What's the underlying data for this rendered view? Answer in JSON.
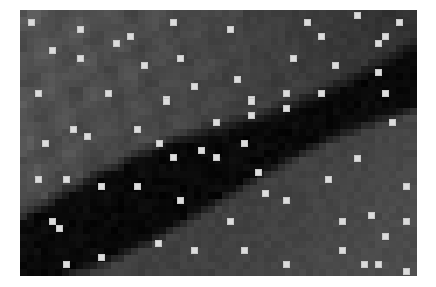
{
  "image": {
    "frame": {
      "x": 20,
      "y": 10,
      "width": 397,
      "height": 266
    },
    "cell_size": 7,
    "colors": {
      "background": "#ffffff",
      "marker": "#dcdcdc",
      "tone_light": "#5c5c5c",
      "tone_mid": "#474747",
      "tone_dark": "#333333",
      "tone_black": "#060606",
      "tone_lower_right": "#4a4a4a"
    },
    "regions": [
      {
        "name": "upper-left-mid-gray",
        "tone": "tone_mid"
      },
      {
        "name": "upper-right-dark-gray",
        "tone": "tone_dark"
      },
      {
        "name": "diagonal-black-band",
        "tone": "tone_black"
      },
      {
        "name": "lower-right-mid-gray",
        "tone": "tone_lower_right"
      }
    ]
  },
  "markers": [
    [
      31,
      22
    ],
    [
      80,
      29
    ],
    [
      130,
      36
    ],
    [
      116,
      43
    ],
    [
      52,
      50
    ],
    [
      80,
      58
    ],
    [
      144,
      65
    ],
    [
      38,
      93
    ],
    [
      108,
      93
    ],
    [
      173,
      22
    ],
    [
      230,
      29
    ],
    [
      180,
      58
    ],
    [
      237,
      79
    ],
    [
      194,
      86
    ],
    [
      166,
      99
    ],
    [
      251,
      99
    ],
    [
      357,
      15
    ],
    [
      307,
      22
    ],
    [
      399,
      22
    ],
    [
      321,
      36
    ],
    [
      385,
      36
    ],
    [
      378,
      43
    ],
    [
      293,
      58
    ],
    [
      335,
      65
    ],
    [
      378,
      72
    ],
    [
      286,
      93
    ],
    [
      321,
      93
    ],
    [
      385,
      93
    ],
    [
      73,
      129
    ],
    [
      137,
      129
    ],
    [
      87,
      136
    ],
    [
      45,
      143
    ],
    [
      38,
      179
    ],
    [
      66,
      179
    ],
    [
      101,
      186
    ],
    [
      137,
      186
    ],
    [
      166,
      101
    ],
    [
      251,
      101
    ],
    [
      251,
      115
    ],
    [
      216,
      122
    ],
    [
      159,
      143
    ],
    [
      244,
      143
    ],
    [
      201,
      150
    ],
    [
      173,
      157
    ],
    [
      216,
      157
    ],
    [
      258,
      172
    ],
    [
      286,
      108
    ],
    [
      392,
      122
    ],
    [
      357,
      158
    ],
    [
      328,
      179
    ],
    [
      406,
      186
    ],
    [
      52,
      221
    ],
    [
      59,
      228
    ],
    [
      101,
      257
    ],
    [
      66,
      264
    ],
    [
      265,
      193
    ],
    [
      180,
      200
    ],
    [
      230,
      221
    ],
    [
      158,
      243
    ],
    [
      194,
      250
    ],
    [
      244,
      250
    ],
    [
      286,
      200
    ],
    [
      371,
      215
    ],
    [
      342,
      221
    ],
    [
      406,
      221
    ],
    [
      385,
      236
    ],
    [
      342,
      250
    ],
    [
      286,
      264
    ],
    [
      364,
      264
    ],
    [
      378,
      264
    ],
    [
      406,
      271
    ]
  ]
}
